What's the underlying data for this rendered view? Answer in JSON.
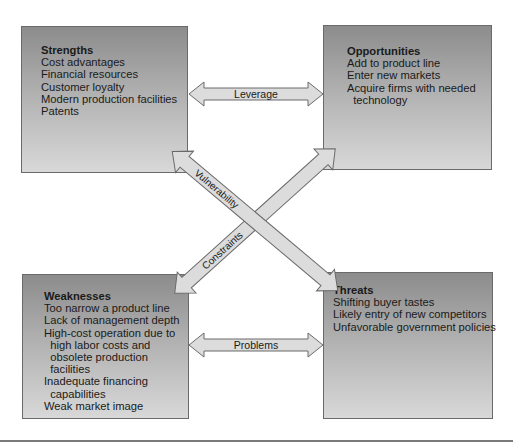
{
  "diagram": {
    "type": "SWOT",
    "boxes": {
      "strengths": {
        "title": "Strengths",
        "items": [
          "Cost advantages",
          "Financial resources",
          "Customer loyalty",
          "Modern production facilities",
          "Patents"
        ]
      },
      "opportunities": {
        "title": "Opportunities",
        "items": [
          "Add to product line",
          "Enter new markets",
          "Acquire firms with needed",
          "  technology"
        ]
      },
      "weaknesses": {
        "title": "Weaknesses",
        "items": [
          "Too narrow a product line",
          "Lack of management depth",
          "High-cost operation due to",
          "  high labor costs and",
          "  obsolete production",
          "  facilities",
          "Inadequate financing",
          "  capabilities",
          "Weak market image"
        ]
      },
      "threats": {
        "title": "Threats",
        "items": [
          "Shifting buyer tastes",
          "Likely entry of new competitors",
          "Unfavorable government policies"
        ]
      }
    },
    "arrows": {
      "leverage": "Leverage",
      "problems": "Problems",
      "vulnerability": "Vulnerability",
      "constraints": "Constraints"
    },
    "colors": {
      "box_top": "#8c8c8c",
      "box_bottom": "#d8d8d8",
      "arrow_fill": "#dcdcdc",
      "stroke": "#6a6a6a"
    }
  }
}
